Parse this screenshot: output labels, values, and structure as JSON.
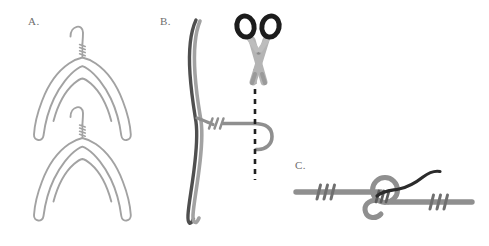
{
  "figure": {
    "background_color": "#ffffff",
    "width": 489,
    "height": 246
  },
  "colors": {
    "wire_light": "#a2a2a2",
    "wire_mid": "#8f8f8f",
    "wire_dark": "#4f4f4f",
    "wire_darkest": "#2b2b2b",
    "scissor_handle": "#1c1c1c",
    "scissor_blade": "#b4b4b4",
    "scissor_blade_shadow": "#9a9a9a",
    "cut_line": "#1f1f1f",
    "label_text": "#6e6e6e"
  },
  "panels": [
    {
      "id": "panel-a",
      "label": "A.",
      "label_x": 28,
      "label_y": 24,
      "description": "Two wire coat hangers nested, each with hook and twisted neck",
      "objects": [
        {
          "name": "hanger-upper",
          "kind": "wire-hanger",
          "color": "#a2a2a2"
        },
        {
          "name": "hanger-lower",
          "kind": "wire-hanger",
          "color": "#a2a2a2"
        }
      ]
    },
    {
      "id": "panel-b",
      "label": "B.",
      "label_x": 160,
      "label_y": 24,
      "description": "Hanger wire held vertically with twisted join and hook end; scissors above a dashed cut line",
      "objects": [
        {
          "name": "wire-dark-vertical",
          "kind": "wire",
          "color": "#4f4f4f"
        },
        {
          "name": "wire-light-vertical",
          "kind": "wire",
          "color": "#a2a2a2"
        },
        {
          "name": "twist-wraps",
          "kind": "twist",
          "count": 3
        },
        {
          "name": "hook-end",
          "kind": "hook",
          "color": "#8f8f8f"
        },
        {
          "name": "scissors",
          "kind": "scissors"
        },
        {
          "name": "cut-line",
          "kind": "dashed-line"
        }
      ]
    },
    {
      "id": "panel-c",
      "label": "C.",
      "label_x": 295,
      "label_y": 168,
      "description": "Two wire segments joined by a looped knot, each secured with three twist wraps, dark wire tail exiting right",
      "objects": [
        {
          "name": "wire-left",
          "kind": "wire",
          "color": "#8f8f8f"
        },
        {
          "name": "wire-right",
          "kind": "wire",
          "color": "#8f8f8f"
        },
        {
          "name": "knot-loop",
          "kind": "loop",
          "color": "#8f8f8f"
        },
        {
          "name": "wire-tail-dark",
          "kind": "wire",
          "color": "#2b2b2b"
        },
        {
          "name": "twist-wraps-left",
          "kind": "twist",
          "count": 3
        },
        {
          "name": "twist-wraps-right",
          "kind": "twist",
          "count": 3
        },
        {
          "name": "twist-wraps-knot",
          "kind": "twist",
          "count": 3
        }
      ]
    }
  ]
}
